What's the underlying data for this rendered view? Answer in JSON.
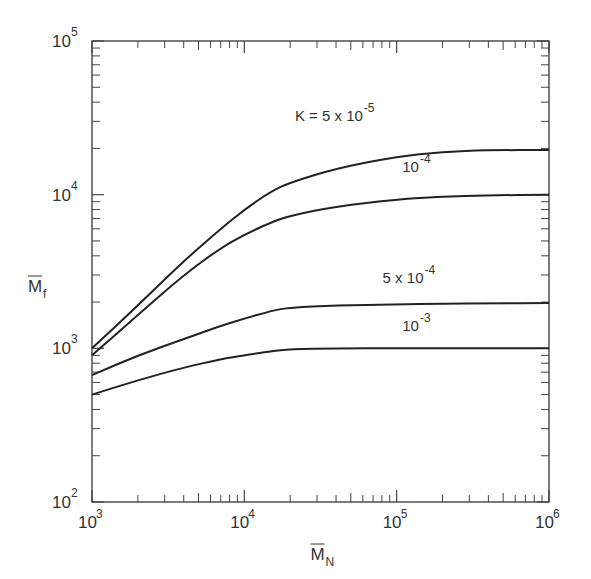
{
  "chart_data": {
    "type": "line",
    "title": "",
    "xlabel": "M̄N",
    "ylabel": "M̄f",
    "xscale": "log",
    "yscale": "log",
    "xlim": [
      1000,
      1000000
    ],
    "ylim": [
      100,
      100000
    ],
    "grid": false,
    "x_ticks": [
      {
        "base": "10",
        "exp": "3",
        "v": 1000
      },
      {
        "base": "10",
        "exp": "4",
        "v": 10000
      },
      {
        "base": "10",
        "exp": "5",
        "v": 100000
      },
      {
        "base": "10",
        "exp": "6",
        "v": 1000000
      }
    ],
    "y_ticks": [
      {
        "base": "10",
        "exp": "2",
        "v": 100
      },
      {
        "base": "10",
        "exp": "3",
        "v": 1000
      },
      {
        "base": "10",
        "exp": "4",
        "v": 10000
      },
      {
        "base": "10",
        "exp": "5",
        "v": 100000
      }
    ],
    "series": [
      {
        "name": "K = 5 x 10^-5",
        "label_main": "K = 5 x 10",
        "label_exp": "-5",
        "label_at": [
          60000,
          30000
        ],
        "x": [
          1000,
          2000,
          4000,
          7000,
          10000,
          15000,
          20000,
          40000,
          100000,
          200000,
          400000,
          1000000
        ],
        "y": [
          1000,
          1900,
          3700,
          6000,
          8000,
          10500,
          12000,
          14800,
          17700,
          19000,
          19500,
          19500
        ]
      },
      {
        "name": "10^-4",
        "label_main": "10",
        "label_exp": "-4",
        "label_at": [
          140000,
          14000
        ],
        "x": [
          1000,
          2000,
          4000,
          7000,
          10000,
          15000,
          20000,
          40000,
          100000,
          200000,
          400000,
          1000000
        ],
        "y": [
          900,
          1650,
          3000,
          4500,
          5500,
          6600,
          7300,
          8400,
          9300,
          9700,
          9900,
          10000
        ]
      },
      {
        "name": "5 x 10^-4",
        "label_main": "5 x 10",
        "label_exp": "-4",
        "label_at": [
          150000,
          2650
        ],
        "x": [
          1000,
          2000,
          4000,
          7000,
          10000,
          15000,
          20000,
          40000,
          100000,
          200000,
          400000,
          1000000
        ],
        "y": [
          670,
          900,
          1150,
          1400,
          1560,
          1750,
          1850,
          1900,
          1930,
          1950,
          1960,
          1970
        ]
      },
      {
        "name": "10^-3",
        "label_main": "10",
        "label_exp": "-3",
        "label_at": [
          140000,
          1300
        ],
        "x": [
          1000,
          2000,
          4000,
          7000,
          10000,
          15000,
          20000,
          40000,
          100000,
          200000,
          400000,
          1000000
        ],
        "y": [
          500,
          620,
          750,
          850,
          900,
          960,
          985,
          1000,
          1000,
          1000,
          1000,
          1000
        ]
      }
    ]
  },
  "axis": {
    "x_label": "M",
    "x_sub": "N",
    "y_label": "M",
    "y_sub": "f"
  }
}
